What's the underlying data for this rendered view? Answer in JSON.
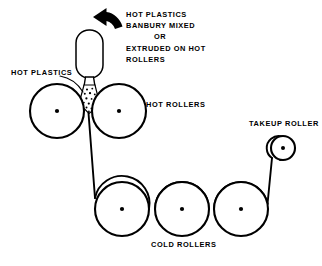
{
  "diagram": {
    "ink_color": "#000000",
    "background_color": "#ffffff",
    "annotation": {
      "lines": [
        "HOT PLASTICS",
        "BANBURY MIXED",
        "OR",
        "EXTRUDED ON HOT",
        "ROLLERS"
      ]
    },
    "labels": {
      "hot_plastics": "HOT PLASTICS",
      "hot_rollers": "HOT ROLLERS",
      "takeup_roller": "TAKEUP ROLLER",
      "cold_rollers": "COLD ROLLERS"
    },
    "hot_rollers": [
      {
        "cx": 57,
        "cy": 111,
        "r": 27
      },
      {
        "cx": 119,
        "cy": 111,
        "r": 27
      }
    ],
    "cold_rollers": [
      {
        "cx": 122,
        "cy": 209,
        "r": 27
      },
      {
        "cx": 182,
        "cy": 209,
        "r": 27
      },
      {
        "cx": 241,
        "cy": 209,
        "r": 27
      }
    ],
    "takeup_roller": {
      "cx": 283,
      "cy": 148,
      "r": 12
    },
    "hopper": {
      "x": 76,
      "y": 30,
      "width": 27,
      "height": 48,
      "corner_radius": 13
    },
    "feed_arrow_direction": "left"
  }
}
